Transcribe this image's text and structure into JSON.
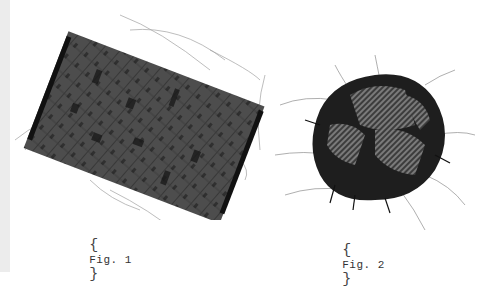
{
  "figures": [
    {
      "label": "Fig. 1",
      "description": "rectangular woven fabric swatch with frayed edges",
      "colors": {
        "fabric": "#4a4a4a",
        "shadow": "#1a1a1a",
        "threads": "#9a9a9a"
      }
    },
    {
      "label": "Fig. 2",
      "description": "crumpled ball of dark twill fabric with loose threads",
      "colors": {
        "fabric": "#2a2a2a",
        "weave": "#6a6a6a",
        "threads": "#8a8a8a"
      }
    }
  ],
  "captions": {
    "open_brace": "{",
    "close_brace": "}"
  }
}
